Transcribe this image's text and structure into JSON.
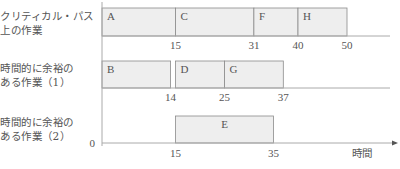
{
  "chart_data": {
    "type": "gantt",
    "title": "",
    "xlabel": "時間",
    "ylabel": "",
    "origin_label": "0",
    "xlim": [
      0,
      60
    ],
    "grid": false,
    "rows": [
      {
        "label_lines": [
          "クリティカル・パス",
          "上の作業"
        ],
        "tasks": [
          {
            "name": "A",
            "start": 0,
            "end": 15
          },
          {
            "name": "C",
            "start": 15,
            "end": 31
          },
          {
            "name": "F",
            "start": 31,
            "end": 40
          },
          {
            "name": "H",
            "start": 40,
            "end": 50
          }
        ],
        "tick_labels": [
          15,
          31,
          40,
          50
        ]
      },
      {
        "label_lines": [
          "時間的に余裕の",
          "ある作業（1）"
        ],
        "tasks": [
          {
            "name": "B",
            "start": 0,
            "end": 14
          },
          {
            "name": "D",
            "start": 15,
            "end": 25
          },
          {
            "name": "G",
            "start": 25,
            "end": 37
          }
        ],
        "tick_labels": [
          14,
          25,
          37
        ]
      },
      {
        "label_lines": [
          "時間的に余裕の",
          "ある作業（2）"
        ],
        "tasks": [
          {
            "name": "E",
            "start": 15,
            "end": 35
          }
        ],
        "tick_labels": [
          15,
          35
        ]
      }
    ],
    "colors": {
      "bar_fill": "#eeeeee",
      "bar_stroke": "#8a8a8a",
      "axis": "#aaaaaa",
      "text": "#555555"
    }
  }
}
